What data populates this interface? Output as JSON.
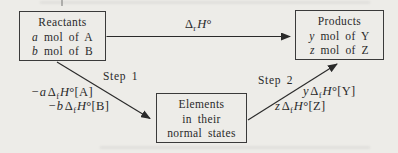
{
  "page": {
    "background": "#edece8",
    "ink": "#2a2a2a",
    "border": "#3a3a3a"
  },
  "boxes": {
    "reactants": {
      "title": "Reactants",
      "lines": [
        {
          "var": "a",
          "rest": " mol of A"
        },
        {
          "var": "b",
          "rest": " mol of B"
        }
      ]
    },
    "products": {
      "title": "Products",
      "lines": [
        {
          "var": "y",
          "rest": " mol of Y"
        },
        {
          "var": "z",
          "rest": " mol of Z"
        }
      ]
    },
    "elements": {
      "lines": [
        "Elements",
        "in their",
        "normal states"
      ]
    }
  },
  "arrows": {
    "reaction": {
      "label": {
        "delta": "Δ",
        "sub": "r",
        "h": "H",
        "post": "°"
      }
    },
    "step1": {
      "name": "Step 1",
      "terms": [
        {
          "coef": "−a",
          "delta": "Δ",
          "sub": "f",
          "h": "H",
          "post": "°[A]"
        },
        {
          "coef": "−b",
          "delta": "Δ",
          "sub": "f",
          "h": "H",
          "post": "°[B]"
        }
      ]
    },
    "step2": {
      "name": "Step 2",
      "terms": [
        {
          "coef": "y",
          "delta": "Δ",
          "sub": "f",
          "h": "H",
          "post": "°[Y]"
        },
        {
          "coef": "z",
          "delta": "Δ",
          "sub": "f",
          "h": "H",
          "post": "°[Z]"
        }
      ]
    }
  }
}
